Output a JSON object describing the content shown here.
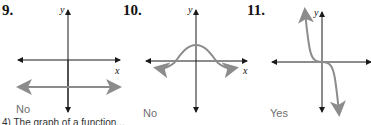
{
  "problems": [
    {
      "number": "9.",
      "answer": "No",
      "graph": "horizontal line below x-axis"
    },
    {
      "number": "10.",
      "answer": "No",
      "graph": "bell-shaped curve crossing x-axis twice"
    },
    {
      "number": "11.",
      "answer": "Yes",
      "graph": "decreasing cubic through origin"
    }
  ],
  "axis_labels": {
    "x": "x",
    "y": "y"
  },
  "colors": {
    "axis": "#1a1a1a",
    "curve": "#8c8c8c",
    "answer": "#6e6e6e"
  },
  "footer_partial_text": "4) The graph of a function..."
}
